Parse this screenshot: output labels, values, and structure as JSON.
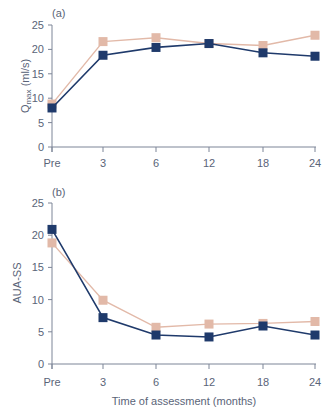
{
  "chart_data": [
    {
      "type": "line",
      "panel_label": "(a)",
      "title": "",
      "xlabel": "",
      "ylabel": "Qmax (ml/s)",
      "ylabel_main": "Q",
      "ylabel_sub": "max",
      "ylabel_unit": " (ml/s)",
      "categories": [
        "Pre",
        "3",
        "6",
        "12",
        "18",
        "24"
      ],
      "yticks": [
        0,
        5,
        10,
        15,
        20,
        25
      ],
      "ylim": [
        0,
        25
      ],
      "grid": false,
      "legend": "none",
      "series": [
        {
          "name": "dark series",
          "color": "#1f3a6b",
          "values": [
            8.0,
            18.8,
            20.4,
            21.2,
            19.3,
            18.6
          ]
        },
        {
          "name": "light series",
          "color": "#e2b9a8",
          "values": [
            8.8,
            21.6,
            22.4,
            21.2,
            20.8,
            22.9
          ]
        }
      ]
    },
    {
      "type": "line",
      "panel_label": "(b)",
      "title": "",
      "xlabel": "Time of assessment (months)",
      "ylabel": "AUA-SS",
      "categories": [
        "Pre",
        "3",
        "6",
        "12",
        "18",
        "24"
      ],
      "yticks": [
        0,
        5,
        10,
        15,
        20,
        25
      ],
      "ylim": [
        0,
        25
      ],
      "grid": false,
      "legend": "none",
      "series": [
        {
          "name": "dark series",
          "color": "#1f3a6b",
          "values": [
            20.9,
            7.2,
            4.5,
            4.2,
            5.9,
            4.5
          ]
        },
        {
          "name": "light series",
          "color": "#e2b9a8",
          "values": [
            18.8,
            9.9,
            5.7,
            6.2,
            6.3,
            6.6
          ]
        }
      ]
    }
  ]
}
